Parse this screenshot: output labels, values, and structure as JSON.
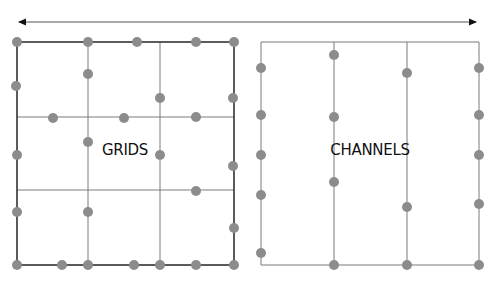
{
  "colors": {
    "background": "#ffffff",
    "line": "#7a7a7a",
    "border_dark": "#333333",
    "dot": "#8c8c8c",
    "arrow": "#555555",
    "text": "#111111"
  },
  "arrow": {
    "y": 22,
    "x1": 17,
    "x2": 478,
    "direction": "bidirectional"
  },
  "panels": [
    {
      "id": "grids",
      "label": "GRIDS",
      "label_pos": [
        125,
        155
      ],
      "frame": {
        "x1": 17,
        "y1": 42,
        "x2": 234,
        "y2": 265
      },
      "vertical_lines": [
        88,
        160
      ],
      "horizontal_lines": [
        117,
        190
      ],
      "dots": [
        [
          17,
          42
        ],
        [
          88,
          42
        ],
        [
          137,
          42
        ],
        [
          196,
          42
        ],
        [
          234,
          42
        ],
        [
          88,
          74
        ],
        [
          16,
          86
        ],
        [
          160,
          98
        ],
        [
          233,
          98
        ],
        [
          53,
          118
        ],
        [
          124,
          118
        ],
        [
          196,
          117
        ],
        [
          88,
          142
        ],
        [
          17,
          155
        ],
        [
          160,
          155
        ],
        [
          233,
          166
        ],
        [
          196,
          191
        ],
        [
          17,
          212
        ],
        [
          88,
          212
        ],
        [
          234,
          228
        ],
        [
          17,
          265
        ],
        [
          62,
          265
        ],
        [
          88,
          265
        ],
        [
          134,
          265
        ],
        [
          160,
          265
        ],
        [
          196,
          265
        ],
        [
          234,
          265
        ]
      ]
    },
    {
      "id": "channels",
      "label": "CHANNELS",
      "label_pos": [
        370,
        155
      ],
      "top_line": {
        "x1": 261,
        "x2": 479,
        "y": 42
      },
      "bottom_line": {
        "x1": 261,
        "x2": 479,
        "y": 265
      },
      "channel_lines": [
        261,
        334,
        407,
        479
      ],
      "dots": [
        [
          261,
          68
        ],
        [
          261,
          115
        ],
        [
          261,
          155
        ],
        [
          261,
          195
        ],
        [
          261,
          253
        ],
        [
          334,
          55
        ],
        [
          334,
          117
        ],
        [
          334,
          182
        ],
        [
          334,
          265
        ],
        [
          407,
          73
        ],
        [
          407,
          207
        ],
        [
          407,
          265
        ],
        [
          479,
          68
        ],
        [
          479,
          115
        ],
        [
          479,
          155
        ],
        [
          479,
          204
        ],
        [
          479,
          265
        ]
      ]
    }
  ]
}
